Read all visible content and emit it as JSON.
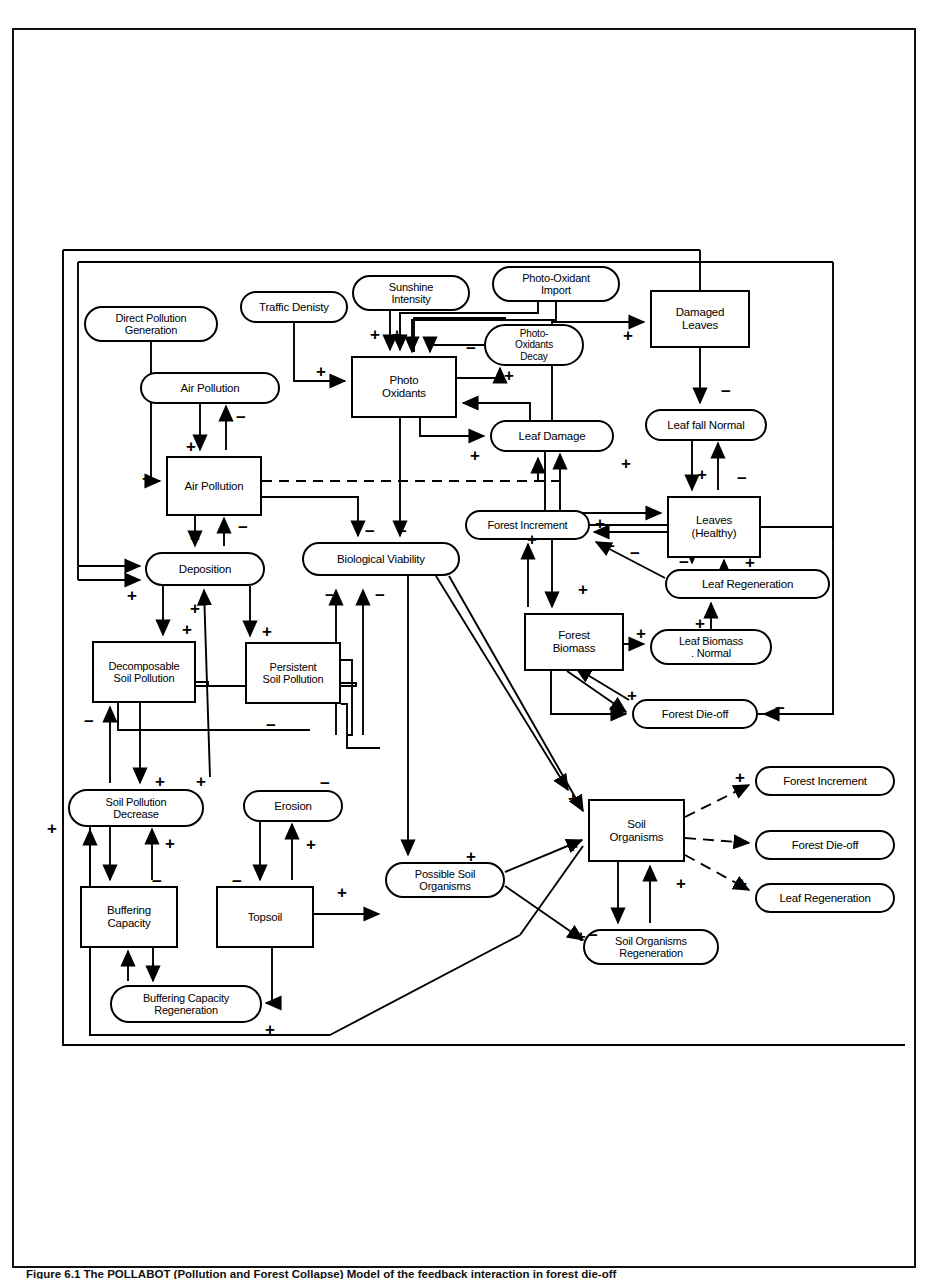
{
  "figure": {
    "caption": "Figure 6.1  The POLLABOT (Pollution and Forest Collapse) Model of the feedback interaction in forest die-off"
  },
  "diagram": {
    "colors": {
      "line": "#000000",
      "background": "#ffffff"
    },
    "nodes": [
      {
        "id": "direct-pollution-generation",
        "label": "Direct Pollution\nGeneration",
        "shape": "round",
        "x": 84,
        "y": 306,
        "w": 134,
        "h": 36,
        "fs": 11
      },
      {
        "id": "traffic-denisty",
        "label": "Traffic Denisty",
        "shape": "round",
        "x": 240,
        "y": 291,
        "w": 108,
        "h": 32,
        "fs": 11.5
      },
      {
        "id": "sunshine-intensity",
        "label": "Sunshine\nIntensity",
        "shape": "round",
        "x": 352,
        "y": 275,
        "w": 118,
        "h": 36,
        "fs": 11
      },
      {
        "id": "photo-oxidant-import",
        "label": "Photo-Oxidant\nImport",
        "shape": "round",
        "x": 492,
        "y": 266,
        "w": 128,
        "h": 36,
        "fs": 11
      },
      {
        "id": "air-pollution-rate",
        "label": "Air Pollution",
        "shape": "round",
        "x": 140,
        "y": 372,
        "w": 140,
        "h": 32,
        "fs": 11.5
      },
      {
        "id": "photo-oxidants-decay",
        "label": "Photo-\nOxidants\nDecay",
        "shape": "round",
        "x": 484,
        "y": 324,
        "w": 100,
        "h": 42,
        "fs": 10
      },
      {
        "id": "photo-oxidants",
        "label": "Photo\nOxidants",
        "shape": "rect",
        "x": 351,
        "y": 356,
        "w": 106,
        "h": 62,
        "fs": 11.5
      },
      {
        "id": "damaged-leaves",
        "label": "Damaged\nLeaves",
        "shape": "rect",
        "x": 650,
        "y": 290,
        "w": 100,
        "h": 58,
        "fs": 11.5
      },
      {
        "id": "leaf-fall-normal",
        "label": "Leaf fall Normal",
        "shape": "round",
        "x": 645,
        "y": 409,
        "w": 122,
        "h": 32,
        "fs": 11.5
      },
      {
        "id": "leaf-damage",
        "label": "Leaf Damage",
        "shape": "round",
        "x": 490,
        "y": 420,
        "w": 124,
        "h": 32,
        "fs": 11.5
      },
      {
        "id": "air-pollution-level",
        "label": "Air Pollution",
        "shape": "rect",
        "x": 166,
        "y": 456,
        "w": 96,
        "h": 60,
        "fs": 11.5
      },
      {
        "id": "leaves-healthy",
        "label": "Leaves\n(Healthy)",
        "shape": "rect",
        "x": 667,
        "y": 496,
        "w": 94,
        "h": 62,
        "fs": 11.5
      },
      {
        "id": "forest-increment",
        "label": "Forest Increment",
        "shape": "round",
        "x": 465,
        "y": 510,
        "w": 125,
        "h": 30,
        "fs": 11
      },
      {
        "id": "biological-viability",
        "label": "Biological Viability",
        "shape": "round",
        "x": 302,
        "y": 542,
        "w": 158,
        "h": 34,
        "fs": 11.5
      },
      {
        "id": "deposition",
        "label": "Deposition",
        "shape": "round",
        "x": 145,
        "y": 552,
        "w": 120,
        "h": 34,
        "fs": 11.5
      },
      {
        "id": "leaf-regeneration",
        "label": "Leaf Regeneration",
        "shape": "round",
        "x": 665,
        "y": 569,
        "w": 165,
        "h": 30,
        "fs": 11.5
      },
      {
        "id": "forest-biomass",
        "label": "Forest\nBiomass",
        "shape": "rect",
        "x": 524,
        "y": 613,
        "w": 100,
        "h": 58,
        "fs": 11.5
      },
      {
        "id": "leaf-biomass-normal",
        "label": "Leaf Biomass\n. Normal",
        "shape": "round",
        "x": 650,
        "y": 629,
        "w": 122,
        "h": 36,
        "fs": 11
      },
      {
        "id": "decomposable-soil-pollution",
        "label": "Decomposable\nSoil Pollution",
        "shape": "rect",
        "x": 92,
        "y": 641,
        "w": 104,
        "h": 62,
        "fs": 11
      },
      {
        "id": "persistent-soil-pollution",
        "label": "Persistent\nSoil Pollution",
        "shape": "rect",
        "x": 245,
        "y": 642,
        "w": 96,
        "h": 62,
        "fs": 11
      },
      {
        "id": "forest-die-off",
        "label": "Forest Die-off",
        "shape": "round",
        "x": 632,
        "y": 699,
        "w": 126,
        "h": 30,
        "fs": 11.5
      },
      {
        "id": "forest-increment-out",
        "label": "Forest Increment",
        "shape": "round",
        "x": 755,
        "y": 766,
        "w": 140,
        "h": 30,
        "fs": 11.5
      },
      {
        "id": "soil-pollution-decrease",
        "label": "Soil Pollution\nDecrease",
        "shape": "round",
        "x": 68,
        "y": 789,
        "w": 136,
        "h": 38,
        "fs": 11
      },
      {
        "id": "erosion",
        "label": "Erosion",
        "shape": "round",
        "x": 243,
        "y": 790,
        "w": 100,
        "h": 32,
        "fs": 11.5
      },
      {
        "id": "soil-organisms",
        "label": "Soil\nOrganisms",
        "shape": "rect",
        "x": 588,
        "y": 799,
        "w": 97,
        "h": 63,
        "fs": 11.5
      },
      {
        "id": "forest-die-off-out",
        "label": "Forest Die-off",
        "shape": "round",
        "x": 755,
        "y": 830,
        "w": 140,
        "h": 30,
        "fs": 11.5
      },
      {
        "id": "possible-soil-organisms",
        "label": "Possible Soil\nOrganisms",
        "shape": "round",
        "x": 385,
        "y": 862,
        "w": 120,
        "h": 36,
        "fs": 11
      },
      {
        "id": "leaf-regeneration-out",
        "label": "Leaf Regeneration",
        "shape": "round",
        "x": 755,
        "y": 883,
        "w": 140,
        "h": 30,
        "fs": 11.5
      },
      {
        "id": "buffering-capacity",
        "label": "Buffering\nCapacity",
        "shape": "rect",
        "x": 80,
        "y": 886,
        "w": 98,
        "h": 62,
        "fs": 11.5
      },
      {
        "id": "topsoil",
        "label": "Topsoil",
        "shape": "rect",
        "x": 216,
        "y": 886,
        "w": 98,
        "h": 62,
        "fs": 11.5
      },
      {
        "id": "soil-organisms-regeneration",
        "label": "Soil Organisms\nRegeneration",
        "shape": "round",
        "x": 583,
        "y": 929,
        "w": 136,
        "h": 36,
        "fs": 11
      },
      {
        "id": "buffering-capacity-regeneration",
        "label": "Buffering Capacity\nRegeneration",
        "shape": "round",
        "x": 110,
        "y": 985,
        "w": 152,
        "h": 38,
        "fs": 11
      }
    ],
    "edge_signs": [
      {
        "id": "sign-pox-plus-left",
        "label": "+",
        "x": 370,
        "y": 326
      },
      {
        "id": "sign-pox-plus-right",
        "label": "+",
        "x": 392,
        "y": 326
      },
      {
        "id": "sign-decay-minus",
        "label": "−",
        "x": 466,
        "y": 340
      },
      {
        "id": "sign-decay-plus",
        "label": "+",
        "x": 504,
        "y": 367
      },
      {
        "id": "sign-traffic-plus",
        "label": "+",
        "x": 316,
        "y": 363
      },
      {
        "id": "sign-damaged-plus",
        "label": "+",
        "x": 623,
        "y": 327
      },
      {
        "id": "sign-airrate-minus",
        "label": "−",
        "x": 236,
        "y": 409
      },
      {
        "id": "sign-airrate-plus",
        "label": "+",
        "x": 186,
        "y": 438
      },
      {
        "id": "sign-leaffall-minus",
        "label": "−",
        "x": 721,
        "y": 383
      },
      {
        "id": "sign-leafdamage-plus",
        "label": "+",
        "x": 470,
        "y": 447
      },
      {
        "id": "sign-leafdmg2-plus",
        "label": "+",
        "x": 621,
        "y": 455
      },
      {
        "id": "sign-airlevel-plus",
        "label": "+",
        "x": 142,
        "y": 470
      },
      {
        "id": "sign-healthy-plus",
        "label": "+",
        "x": 697,
        "y": 466
      },
      {
        "id": "sign-healthy-minus",
        "label": "−",
        "x": 737,
        "y": 470
      },
      {
        "id": "sign-dep-minus",
        "label": "−",
        "x": 238,
        "y": 519
      },
      {
        "id": "sign-dep-plus",
        "label": "+",
        "x": 190,
        "y": 530
      },
      {
        "id": "sign-bio-minus1",
        "label": "−",
        "x": 365,
        "y": 523
      },
      {
        "id": "sign-bio-minus2",
        "label": "−",
        "x": 397,
        "y": 523
      },
      {
        "id": "sign-fi-plus",
        "label": "+",
        "x": 595,
        "y": 515
      },
      {
        "id": "sign-fi-minus",
        "label": "−",
        "x": 605,
        "y": 538
      },
      {
        "id": "sign-leaves-minus",
        "label": "−",
        "x": 630,
        "y": 545
      },
      {
        "id": "sign-leafregen-minus",
        "label": "−",
        "x": 679,
        "y": 554
      },
      {
        "id": "sign-leafregen-plus",
        "label": "+",
        "x": 745,
        "y": 554
      },
      {
        "id": "sign-fb-plus",
        "label": "+",
        "x": 527,
        "y": 531
      },
      {
        "id": "sign-fb-plus2",
        "label": "+",
        "x": 578,
        "y": 581
      },
      {
        "id": "sign-bio-minus3",
        "label": "−",
        "x": 325,
        "y": 587
      },
      {
        "id": "sign-bio-minus4",
        "label": "−",
        "x": 375,
        "y": 587
      },
      {
        "id": "sign-dep-in-plus",
        "label": "+",
        "x": 127,
        "y": 587
      },
      {
        "id": "sign-dep-out-plus",
        "label": "+",
        "x": 190,
        "y": 600
      },
      {
        "id": "sign-decomp-plus",
        "label": "+",
        "x": 182,
        "y": 621
      },
      {
        "id": "sign-persist-plus",
        "label": "+",
        "x": 262,
        "y": 623
      },
      {
        "id": "sign-leafbio-plus",
        "label": "+",
        "x": 636,
        "y": 625
      },
      {
        "id": "sign-leafbio-plus2",
        "label": "+",
        "x": 695,
        "y": 615
      },
      {
        "id": "sign-dieoff-plus",
        "label": "+",
        "x": 627,
        "y": 687
      },
      {
        "id": "sign-dieoff-minus",
        "label": "−",
        "x": 775,
        "y": 700
      },
      {
        "id": "sign-decomp-minus",
        "label": "−",
        "x": 84,
        "y": 713
      },
      {
        "id": "sign-persist-minus",
        "label": "−",
        "x": 266,
        "y": 717
      },
      {
        "id": "sign-spd-plus1",
        "label": "+",
        "x": 155,
        "y": 773
      },
      {
        "id": "sign-spd-plus2",
        "label": "+",
        "x": 196,
        "y": 773
      },
      {
        "id": "sign-erosion-minus",
        "label": "−",
        "x": 320,
        "y": 775
      },
      {
        "id": "sign-fi-out-plus",
        "label": "+",
        "x": 735,
        "y": 769
      },
      {
        "id": "sign-so-in-plus1",
        "label": "+",
        "x": 568,
        "y": 790
      },
      {
        "id": "sign-spd-left-plus",
        "label": "+",
        "x": 47,
        "y": 820
      },
      {
        "id": "sign-buff-plus",
        "label": "+",
        "x": 165,
        "y": 835
      },
      {
        "id": "sign-eros-plus",
        "label": "+",
        "x": 306,
        "y": 836
      },
      {
        "id": "sign-so-in-plus2",
        "label": "+",
        "x": 568,
        "y": 838
      },
      {
        "id": "sign-fdo-out-minus",
        "label": "−",
        "x": 737,
        "y": 833
      },
      {
        "id": "sign-pso-plus",
        "label": "+",
        "x": 466,
        "y": 848
      },
      {
        "id": "sign-buff-minus",
        "label": "−",
        "x": 152,
        "y": 873
      },
      {
        "id": "sign-topsoil-minus",
        "label": "−",
        "x": 232,
        "y": 873
      },
      {
        "id": "sign-sor-plus",
        "label": "+",
        "x": 676,
        "y": 875
      },
      {
        "id": "sign-lr-out-plus",
        "label": "+",
        "x": 737,
        "y": 875
      },
      {
        "id": "sign-topsoil-plus",
        "label": "+",
        "x": 337,
        "y": 884
      },
      {
        "id": "sign-sor-minus",
        "label": "−",
        "x": 588,
        "y": 927
      },
      {
        "id": "sign-sor-plus2",
        "label": "+",
        "x": 576,
        "y": 928
      },
      {
        "id": "sign-buffregen-plus",
        "label": "+",
        "x": 148,
        "y": 959
      },
      {
        "id": "sign-buffregen-plus2",
        "label": "+",
        "x": 265,
        "y": 1021
      }
    ]
  }
}
